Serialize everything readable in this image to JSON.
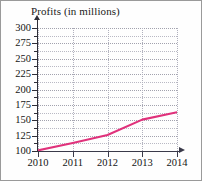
{
  "chart_data": {
    "type": "line",
    "title": "Profits (in millions)",
    "xlabel": "",
    "ylabel": "",
    "x": [
      2010,
      2011,
      2012,
      2013,
      2014
    ],
    "categories": [
      "2010",
      "2011",
      "2012",
      "2013",
      "2014"
    ],
    "values": [
      101,
      113,
      126,
      151,
      163
    ],
    "series": [
      {
        "name": "Profits",
        "values": [
          101,
          113,
          126,
          151,
          163
        ],
        "color": "#e0317b"
      }
    ],
    "ylim": [
      100,
      300
    ],
    "xlim": [
      2010,
      2014
    ],
    "ytick_labels": [
      "300",
      "275",
      "250",
      "225",
      "200",
      "175",
      "150",
      "125",
      "100"
    ],
    "ytick_values": [
      300,
      275,
      250,
      225,
      200,
      175,
      150,
      125,
      100
    ],
    "ytick_step": 25,
    "xtick_labels": [
      "2010",
      "2011",
      "2012",
      "2013",
      "2014"
    ],
    "grid": true,
    "legend": null,
    "line_color": "#e0317b",
    "axis_color": "#2e2e38",
    "grid_color": "#b9b9c4"
  }
}
